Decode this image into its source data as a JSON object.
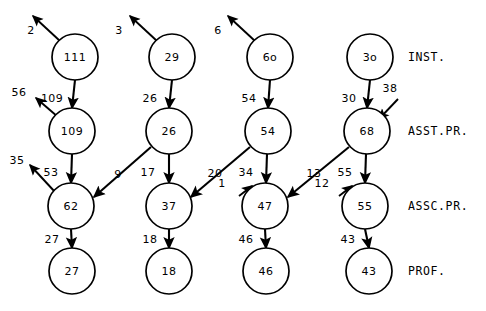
{
  "diagram": {
    "geometry": {
      "width": 486,
      "height": 311,
      "node_radius": 23
    },
    "colors": {
      "stroke": "#000000",
      "background": "#ffffff",
      "text": "#000000"
    },
    "rank_labels": [
      {
        "name": "inst",
        "text": "INST.",
        "x": 408,
        "y": 57
      },
      {
        "name": "asst-pr",
        "text": "ASST.PR.",
        "x": 408,
        "y": 131
      },
      {
        "name": "assc-pr",
        "text": "ASSC.PR.",
        "x": 408,
        "y": 206
      },
      {
        "name": "prof",
        "text": "PROF.",
        "x": 408,
        "y": 271
      }
    ],
    "nodes": [
      {
        "id": "n-111",
        "value": "111",
        "x": 75,
        "y": 57,
        "row": "inst",
        "col": 1
      },
      {
        "id": "n-29",
        "value": "29",
        "x": 172,
        "y": 57,
        "row": "inst",
        "col": 2
      },
      {
        "id": "n-6o",
        "value": "6o",
        "x": 270,
        "y": 57,
        "row": "inst",
        "col": 3
      },
      {
        "id": "n-3o",
        "value": "3o",
        "x": 370,
        "y": 57,
        "row": "inst",
        "col": 4
      },
      {
        "id": "n-109",
        "value": "109",
        "x": 72,
        "y": 131,
        "row": "asst-pr",
        "col": 1
      },
      {
        "id": "n-26",
        "value": "26",
        "x": 169,
        "y": 131,
        "row": "asst-pr",
        "col": 2
      },
      {
        "id": "n-54",
        "value": "54",
        "x": 268,
        "y": 131,
        "row": "asst-pr",
        "col": 3
      },
      {
        "id": "n-68",
        "value": "68",
        "x": 367,
        "y": 131,
        "row": "asst-pr",
        "col": 4
      },
      {
        "id": "n-62",
        "value": "62",
        "x": 71,
        "y": 206,
        "row": "assc-pr",
        "col": 1
      },
      {
        "id": "n-37",
        "value": "37",
        "x": 169,
        "y": 206,
        "row": "assc-pr",
        "col": 2
      },
      {
        "id": "n-47",
        "value": "47",
        "x": 265,
        "y": 206,
        "row": "assc-pr",
        "col": 3
      },
      {
        "id": "n-55",
        "value": "55",
        "x": 365,
        "y": 206,
        "row": "assc-pr",
        "col": 4
      },
      {
        "id": "n-27",
        "value": "27",
        "x": 72,
        "y": 271,
        "row": "prof",
        "col": 1
      },
      {
        "id": "n-18",
        "value": "18",
        "x": 169,
        "y": 271,
        "row": "prof",
        "col": 2
      },
      {
        "id": "n-46",
        "value": "46",
        "x": 266,
        "y": 271,
        "row": "prof",
        "col": 3
      },
      {
        "id": "n-43",
        "value": "43",
        "x": 369,
        "y": 271,
        "row": "prof",
        "col": 4
      }
    ],
    "edges": [
      {
        "id": "e-111-109",
        "from": "n-111",
        "to": "n-109",
        "label": "109",
        "lx": 52,
        "ly": 99,
        "x1": 75,
        "y1": 80,
        "x2": 72,
        "y2": 108
      },
      {
        "id": "e-29-26",
        "from": "n-29",
        "to": "n-26",
        "label": "26",
        "lx": 150,
        "ly": 99,
        "x1": 172,
        "y1": 80,
        "x2": 169,
        "y2": 108
      },
      {
        "id": "e-6o-54",
        "from": "n-6o",
        "to": "n-54",
        "label": "54",
        "lx": 249,
        "ly": 99,
        "x1": 270,
        "y1": 80,
        "x2": 268,
        "y2": 108
      },
      {
        "id": "e-3o-68",
        "from": "n-3o",
        "to": "n-68",
        "label": "30",
        "lx": 349,
        "ly": 99,
        "x1": 370,
        "y1": 80,
        "x2": 367,
        "y2": 108
      },
      {
        "id": "e-109-62",
        "from": "n-109",
        "to": "n-62",
        "label": "53",
        "lx": 51,
        "ly": 173,
        "x1": 72,
        "y1": 154,
        "x2": 71,
        "y2": 183
      },
      {
        "id": "e-26-37",
        "from": "n-26",
        "to": "n-37",
        "label": "17",
        "lx": 148,
        "ly": 173,
        "x1": 169,
        "y1": 154,
        "x2": 169,
        "y2": 183
      },
      {
        "id": "e-54-47",
        "from": "n-54",
        "to": "n-47",
        "label": "34",
        "lx": 246,
        "ly": 173,
        "x1": 267,
        "y1": 154,
        "x2": 266,
        "y2": 183
      },
      {
        "id": "e-68-55",
        "from": "n-68",
        "to": "n-55",
        "label": "55",
        "lx": 345,
        "ly": 173,
        "x1": 366,
        "y1": 154,
        "x2": 365,
        "y2": 183
      },
      {
        "id": "e-62-27",
        "from": "n-62",
        "to": "n-27",
        "label": "27",
        "lx": 52,
        "ly": 240,
        "x1": 71,
        "y1": 229,
        "x2": 72,
        "y2": 248
      },
      {
        "id": "e-37-18",
        "from": "n-37",
        "to": "n-18",
        "label": "18",
        "lx": 150,
        "ly": 240,
        "x1": 169,
        "y1": 229,
        "x2": 169,
        "y2": 248
      },
      {
        "id": "e-47-46",
        "from": "n-47",
        "to": "n-46",
        "label": "46",
        "lx": 246,
        "ly": 240,
        "x1": 265,
        "y1": 229,
        "x2": 266,
        "y2": 248
      },
      {
        "id": "e-55-43",
        "from": "n-55",
        "to": "n-43",
        "label": "43",
        "lx": 348,
        "ly": 240,
        "x1": 365,
        "y1": 229,
        "x2": 369,
        "y2": 248
      },
      {
        "id": "e-26-62",
        "from": "n-26",
        "to": "n-62",
        "label": "9",
        "lx": 118,
        "ly": 175,
        "x1": 151,
        "y1": 147,
        "x2": 94,
        "y2": 197
      },
      {
        "id": "e-54-37",
        "from": "n-54",
        "to": "n-37",
        "label": "20",
        "lx": 215,
        "ly": 174,
        "x1": 250,
        "y1": 147,
        "x2": 191,
        "y2": 197
      },
      {
        "id": "e-68-47",
        "from": "n-68",
        "to": "n-47",
        "label": "13",
        "lx": 314,
        "ly": 174,
        "x1": 349,
        "y1": 147,
        "x2": 288,
        "y2": 197
      }
    ],
    "external_out": [
      {
        "id": "x-111",
        "label": "2",
        "lx": 31,
        "ly": 31,
        "x1": 60,
        "y1": 41,
        "x2": 33,
        "y2": 16
      },
      {
        "id": "x-29",
        "label": "3",
        "lx": 119,
        "ly": 31,
        "x1": 157,
        "y1": 41,
        "x2": 130,
        "y2": 16
      },
      {
        "id": "x-6o",
        "label": "6",
        "lx": 218,
        "ly": 31,
        "x1": 255,
        "y1": 41,
        "x2": 228,
        "y2": 16
      },
      {
        "id": "x-109",
        "label": "56",
        "lx": 19,
        "ly": 93,
        "x1": 58,
        "y1": 117,
        "x2": 36,
        "y2": 98
      },
      {
        "id": "x-62",
        "label": "35",
        "lx": 17,
        "ly": 161,
        "x1": 55,
        "y1": 192,
        "x2": 30,
        "y2": 165
      }
    ],
    "external_in": [
      {
        "id": "i-68",
        "label": "38",
        "lx": 390,
        "ly": 89,
        "x1": 398,
        "y1": 99,
        "x2": 379,
        "y2": 119
      },
      {
        "id": "i-47",
        "label": "1",
        "lx": 222,
        "ly": 184,
        "x1": 239,
        "y1": 196,
        "x2": 252,
        "y2": 186
      },
      {
        "id": "i-55",
        "label": "12",
        "lx": 322,
        "ly": 184,
        "x1": 339,
        "y1": 196,
        "x2": 352,
        "y2": 186
      }
    ]
  }
}
